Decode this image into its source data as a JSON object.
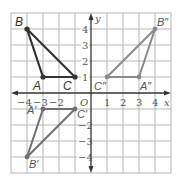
{
  "diagram": {
    "type": "coordinate-plane-transformations",
    "grid": {
      "xmin": -5,
      "xmax": 5,
      "ymin": -5,
      "ymax": 5,
      "cell_px": 16,
      "origin_px": [
        91,
        93
      ]
    },
    "axes": {
      "x_label": "x",
      "y_label": "y",
      "origin_label": "O",
      "x_ticks": [
        {
          "value": -4,
          "label": "−4"
        },
        {
          "value": -3,
          "label": "−3"
        },
        {
          "value": -2,
          "label": "−2"
        },
        {
          "value": 1,
          "label": "1"
        },
        {
          "value": 2,
          "label": "2"
        },
        {
          "value": 3,
          "label": "3"
        },
        {
          "value": 4,
          "label": "4"
        }
      ],
      "y_ticks": [
        {
          "value": 4,
          "label": "4"
        },
        {
          "value": 3,
          "label": "3"
        },
        {
          "value": 2,
          "label": "2"
        },
        {
          "value": 1,
          "label": "1"
        },
        {
          "value": -2,
          "label": "−2"
        },
        {
          "value": -3,
          "label": "−3"
        },
        {
          "value": -4,
          "label": "−4"
        }
      ]
    },
    "triangles": [
      {
        "name": "ABC",
        "color": "#333333",
        "vertices": [
          {
            "label": "A",
            "x": -3,
            "y": 1
          },
          {
            "label": "B",
            "x": -4,
            "y": 4
          },
          {
            "label": "C",
            "x": -1,
            "y": 1
          }
        ]
      },
      {
        "name": "A'B'C'",
        "color": "#777777",
        "vertices": [
          {
            "label": "A'",
            "x": -3,
            "y": -1
          },
          {
            "label": "B'",
            "x": -4,
            "y": -4
          },
          {
            "label": "C'",
            "x": -1,
            "y": -1
          }
        ]
      },
      {
        "name": "A''B''C''",
        "color": "#888888",
        "vertices": [
          {
            "label": "A''",
            "x": 3,
            "y": 1
          },
          {
            "label": "B''",
            "x": 4,
            "y": 4
          },
          {
            "label": "C''",
            "x": 1,
            "y": 1
          }
        ]
      }
    ]
  },
  "labels": {
    "x_axis": "x",
    "y_axis": "y",
    "origin": "O",
    "A": "A",
    "B": "B",
    "C": "C",
    "A1": "A′",
    "B1": "B′",
    "C1": "C′",
    "A2": "A″",
    "B2": "B″",
    "C2": "C″",
    "xt_m4": "−4",
    "xt_m3": "−3",
    "xt_m2": "−2",
    "xt_1": "1",
    "xt_2": "2",
    "xt_3": "3",
    "xt_4": "4",
    "yt_4": "4",
    "yt_3": "3",
    "yt_2": "2",
    "yt_1": "1",
    "yt_m2": "−2",
    "yt_m3": "−3",
    "yt_m4": "−4"
  }
}
